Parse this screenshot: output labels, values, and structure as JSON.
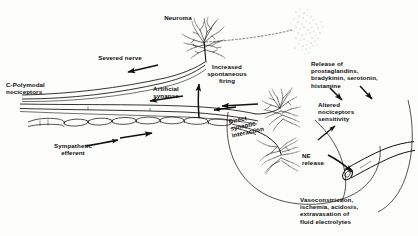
{
  "figure": {
    "style": "black and white line drawing",
    "ink_color": "#111111",
    "background_color": "#ffffff",
    "width": 418,
    "height": 236
  },
  "labels": {
    "neuroma": "Neuroma",
    "severed_nerve": "Severed nerve",
    "c_polymodal": "C-Polymodal\nnociceptors",
    "artificial_synapse": "Artificial\nsynapse",
    "sympathetic_efferent": "Sympathetic\nefferent",
    "increased_firing": "Increased\nspontaneous\nfiring",
    "release_of": "Release of\nprostaglandins,\nbradykinin, serotonin,\nhistamine",
    "altered_sensitivity": "Altered\nnociceptors\nsensitivity",
    "direct_synaptic": "Direct\nsynaptic\ninteraction",
    "ne_release": "NE\nrelease",
    "vasoconstriction": "Vasoconstriction,\nischemia, acidosis,\nextravasation of\nfluid electrolytes"
  },
  "structures": {
    "neuroma_sprout": "neuroma-arborization",
    "ectopic_cloud": "stippled-ectopic-discharge-cloud",
    "dotted_trajectory": "dotted-ectopic-path",
    "nerve_bundle": "c-fiber-nerve-bundle",
    "myelinated_fiber": "sympathetic-myelinated-fiber",
    "terminal_upper": "upper-nerve-terminal-arborization",
    "terminal_lower": "lower-nerve-terminal-arborization",
    "blood_vessel": "blood-vessel-cut-end"
  },
  "arrows": {
    "severed_nerve_flow": "leftward-conduction-arrow",
    "artificial_synapse_flow": "leftward-conduction-arrow",
    "sympathetic_flow": "rightward-efferent-arrow",
    "terminal_flow": "leftward-terminal-arrow",
    "increased_firing_up": "upward-arrow-to-firing",
    "release_down_left": "downward-arrow-mediators-left",
    "release_down_right": "downward-arrow-mediators-right",
    "altered_sensitivity_up": "upward-arrow-to-sensitivity",
    "ne_release_down": "downward-arrow-to-vessel",
    "feedback_loop_inner": "curved-feedback-loop",
    "feedback_loop_outer": "curved-feedback-loop-outer"
  }
}
